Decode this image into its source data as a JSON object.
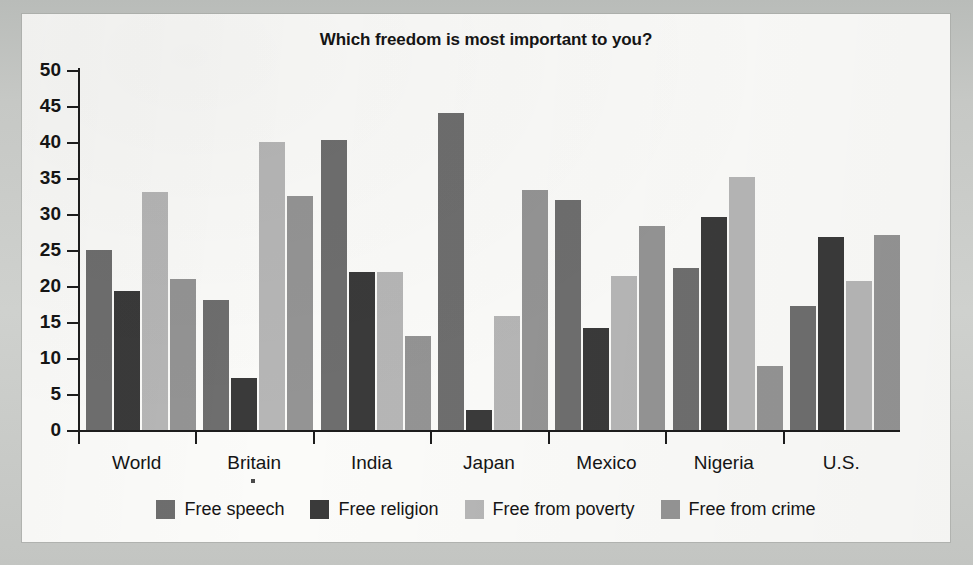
{
  "chart_data": {
    "type": "bar",
    "title": "Which freedom is most important to you?",
    "xlabel": "",
    "ylabel": "",
    "ylim": [
      0,
      50
    ],
    "yticks": [
      0,
      5,
      10,
      15,
      20,
      25,
      30,
      35,
      40,
      45,
      50
    ],
    "grid": false,
    "legend_position": "bottom",
    "categories": [
      "World",
      "Britain",
      "India",
      "Japan",
      "Mexico",
      "Nigeria",
      "U.S."
    ],
    "series": [
      {
        "name": "Free speech",
        "color": "#6e6e6e",
        "values": [
          25,
          18,
          40.3,
          44,
          32,
          22.5,
          17.2
        ]
      },
      {
        "name": "Free religion",
        "color": "#3a3a3a",
        "values": [
          19.3,
          7.2,
          22,
          2.8,
          14.2,
          29.6,
          26.8
        ]
      },
      {
        "name": "Free from poverty",
        "color": "#b6b6b6",
        "values": [
          33,
          40,
          22,
          15.9,
          21.4,
          35.1,
          20.7
        ]
      },
      {
        "name": "Free from crime",
        "color": "#949494",
        "values": [
          21,
          32.5,
          13.1,
          33.4,
          28.3,
          8.9,
          27.1
        ]
      }
    ]
  }
}
